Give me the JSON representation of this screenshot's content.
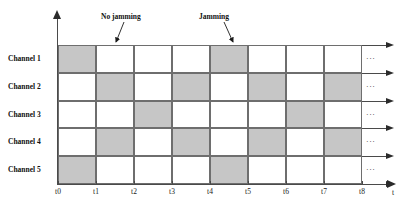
{
  "figure": {
    "colors": {
      "shaded_cell": "#c6c6c6",
      "empty_cell": "#ffffff",
      "grid_line": "#6e6e6e",
      "axis": "#4a4a4a",
      "text": "#111111"
    }
  },
  "axes": {
    "x_axis_label": "t",
    "y_axis_label": "",
    "tick_labels": [
      "t0",
      "t1",
      "t2",
      "t3",
      "t4",
      "t5",
      "t6",
      "t7",
      "t8"
    ]
  },
  "channels": [
    {
      "label": "Channel 1"
    },
    {
      "label": "Channel 2"
    },
    {
      "label": "Channel 3"
    },
    {
      "label": "Channel 4"
    },
    {
      "label": "Channel 5"
    }
  ],
  "row_continuation": {
    "ellipsis": "···",
    "arrow": "right-arrow"
  },
  "annotations": [
    {
      "label": "No jamming",
      "target_slot": "t1",
      "target_channel": "Channel 1"
    },
    {
      "label": "Jamming",
      "target_slot": "t4",
      "target_channel": "Channel 1"
    }
  ],
  "chart_data": {
    "type": "heatmap",
    "title": "",
    "xlabel": "t",
    "ylabel": "",
    "x": [
      "t0",
      "t1",
      "t2",
      "t3",
      "t4",
      "t5",
      "t6",
      "t7"
    ],
    "categories": [
      "Channel 1",
      "Channel 2",
      "Channel 3",
      "Channel 4",
      "Channel 5"
    ],
    "legend": [],
    "grid": true,
    "values": [
      [
        1,
        0,
        0,
        0,
        1,
        0,
        0,
        0
      ],
      [
        0,
        1,
        0,
        1,
        0,
        1,
        0,
        1
      ],
      [
        0,
        0,
        1,
        0,
        0,
        0,
        1,
        0
      ],
      [
        0,
        1,
        0,
        1,
        0,
        1,
        0,
        1
      ],
      [
        1,
        0,
        0,
        0,
        1,
        0,
        0,
        0
      ]
    ],
    "value_meaning": {
      "1": "occupied (shaded)",
      "0": "idle (white)"
    }
  }
}
